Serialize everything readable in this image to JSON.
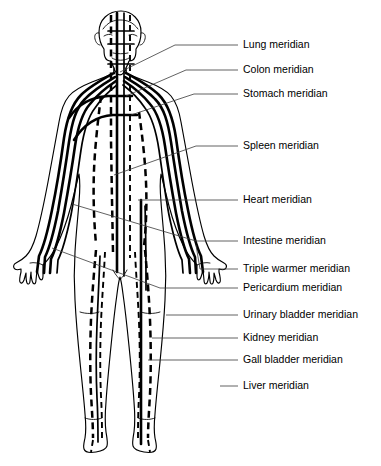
{
  "figure": {
    "view": "anterior full-body outline",
    "background_color": "#ffffff",
    "line_color": "#000000",
    "leader_color": "#3a3a3a",
    "text_color": "#000000"
  },
  "labels": [
    {
      "id": "lung",
      "text": "Lung meridian",
      "text_x": 243,
      "y": 45,
      "leader_x1": 238,
      "leader_x2": 175,
      "anchor_x": 120,
      "anchor_y": 72,
      "style": "angled"
    },
    {
      "id": "colon",
      "text": "Colon meridian",
      "text_x": 243,
      "y": 70,
      "leader_x1": 238,
      "leader_x2": 186,
      "anchor_x": 126,
      "anchor_y": 96,
      "style": "angled"
    },
    {
      "id": "stomach",
      "text": "Stomach meridian",
      "text_x": 243,
      "y": 94,
      "leader_x1": 238,
      "leader_x2": 194,
      "anchor_x": 131,
      "anchor_y": 115,
      "style": "angled"
    },
    {
      "id": "spleen",
      "text": "Spleen meridian",
      "text_x": 243,
      "y": 146,
      "leader_x1": 238,
      "leader_x2": 196,
      "anchor_x": 114,
      "anchor_y": 175,
      "style": "angled"
    },
    {
      "id": "heart",
      "text": "Heart meridian",
      "text_x": 243,
      "y": 200,
      "leader_x1": 238,
      "leader_x2": 190,
      "anchor_x": 138,
      "anchor_y": 200,
      "style": "angled"
    },
    {
      "id": "intestine",
      "text": "Intestine meridian",
      "text_x": 243,
      "y": 241,
      "leader_x1": 238,
      "leader_x2": 196,
      "anchor_x": 72,
      "anchor_y": 204,
      "style": "angled"
    },
    {
      "id": "triple-warmer",
      "text": "Triple warmer meridian",
      "text_x": 243,
      "y": 269,
      "leader_x1": 238,
      "leader_x2": 200,
      "anchor_x": 196,
      "anchor_y": 245,
      "style": "angled"
    },
    {
      "id": "pericardium",
      "text": "Pericardium meridian",
      "text_x": 243,
      "y": 288,
      "leader_x1": 238,
      "leader_x2": 160,
      "anchor_x": 52,
      "anchor_y": 248,
      "style": "angled"
    },
    {
      "id": "urinary-bladder",
      "text": "Urinary bladder meridian",
      "text_x": 243,
      "y": 315,
      "leader_x1": 238,
      "leader_x2": 166,
      "anchor_x": 166,
      "anchor_y": 315,
      "style": "straight"
    },
    {
      "id": "kidney",
      "text": "Kidney meridian",
      "text_x": 243,
      "y": 338,
      "leader_x1": 238,
      "leader_x2": 152,
      "anchor_x": 152,
      "anchor_y": 338,
      "style": "straight"
    },
    {
      "id": "gall-bladder",
      "text": "Gall bladder meridian",
      "text_x": 243,
      "y": 360,
      "leader_x1": 238,
      "leader_x2": 148,
      "anchor_x": 148,
      "anchor_y": 360,
      "style": "straight"
    },
    {
      "id": "liver",
      "text": "Liver meridian",
      "text_x": 243,
      "y": 386,
      "leader_x1": 238,
      "leader_x2": 220,
      "anchor_x": 220,
      "anchor_y": 386,
      "style": "straight"
    }
  ],
  "meridian_counts": {
    "total_labeled": 12,
    "solid_lines": "head, neck, shoulders, arms, hands",
    "dashed_lines": "torso, abdomen, legs, feet"
  }
}
